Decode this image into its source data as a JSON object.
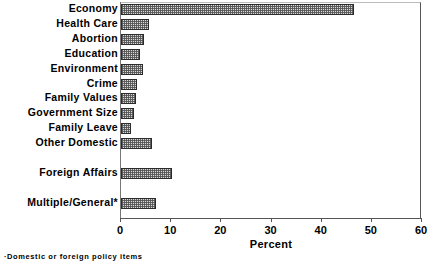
{
  "chart_data": {
    "type": "bar",
    "orientation": "horizontal",
    "title": "",
    "xlabel": "Percent",
    "ylabel": "",
    "xlim": [
      0,
      60
    ],
    "xticks": [
      0,
      10,
      20,
      30,
      40,
      50,
      60
    ],
    "xtick_labels": [
      "0",
      "10",
      "20",
      "30",
      "40",
      "50",
      "60"
    ],
    "grid": false,
    "legend": null,
    "categories": [
      "Economy",
      "Health Care",
      "Abortion",
      "Education",
      "Environment",
      "Crime",
      "Family Values",
      "Government Size",
      "Family Leave",
      "Other Domestic",
      "Foreign Affairs",
      "Multiple/General*"
    ],
    "values": [
      46.4,
      5.5,
      4.5,
      3.8,
      4.3,
      3.1,
      2.9,
      2.5,
      2.0,
      6.1,
      10.2,
      6.9
    ],
    "annotations": [
      "·Domestic or foreign policy items"
    ],
    "bar_fill": "#d9d9d9",
    "bar_edge": "#2b2b2b"
  },
  "footnote": "·Domestic or foreign policy items",
  "axis": {
    "xlabel": "Percent"
  }
}
